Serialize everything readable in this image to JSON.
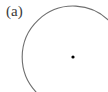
{
  "figure": {
    "label": "(a)",
    "circle": {
      "center": [
        73,
        57
      ],
      "radius": 51,
      "arc_color": "#6e6e6e",
      "gap": "bottom-right",
      "center_dot_color": "#000000"
    }
  }
}
